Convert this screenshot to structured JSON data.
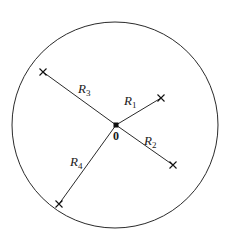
{
  "diagram": {
    "circle": {
      "cx": 115,
      "cy": 125,
      "r": 103,
      "stroke": "#2a2a2a"
    },
    "origin": {
      "x": 116,
      "y": 125,
      "label": "0",
      "label_x": 116,
      "label_y": 140
    },
    "line_color": "#2a2a2a",
    "radii": [
      {
        "id": "R1",
        "base": "R",
        "sub": "1",
        "end_x": 161,
        "end_y": 98,
        "label_x": 124,
        "label_y": 105
      },
      {
        "id": "R2",
        "base": "R",
        "sub": "2",
        "end_x": 173,
        "end_y": 165,
        "label_x": 144,
        "label_y": 145
      },
      {
        "id": "R3",
        "base": "R",
        "sub": "3",
        "end_x": 43,
        "end_y": 72,
        "label_x": 78,
        "label_y": 93
      },
      {
        "id": "R4",
        "base": "R",
        "sub": "4",
        "end_x": 59,
        "end_y": 204,
        "label_x": 70,
        "label_y": 166
      }
    ]
  }
}
